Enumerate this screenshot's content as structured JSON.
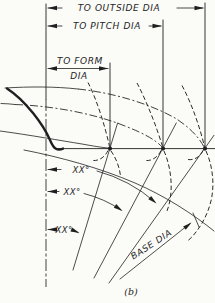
{
  "figure": {
    "caption": "(b)",
    "labels": {
      "to_outside_dia": "TO OUTSIDE DIA",
      "to_pitch_dia": "TO PITCH DIA",
      "to_form_line1": "TO FORM",
      "to_form_line2": "DIA",
      "angle_outside": "XX°",
      "angle_pitch": "XX°",
      "angle_form": "XX°",
      "base_dia": "BASE DIA"
    },
    "colors": {
      "ink": "#1f1f1f",
      "paper": "#fbfbf8"
    }
  }
}
